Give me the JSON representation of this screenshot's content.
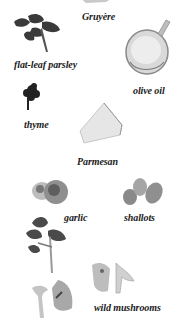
{
  "ingredients": [
    {
      "name": "Gruyère",
      "label": "Gruyère"
    },
    {
      "name": "flat-leaf parsley",
      "label": "flat-leaf parsley"
    },
    {
      "name": "olive oil",
      "label": "olive oil"
    },
    {
      "name": "thyme",
      "label": "thyme"
    },
    {
      "name": "Parmesan",
      "label": "Parmesan"
    },
    {
      "name": "garlic",
      "label": "garlic"
    },
    {
      "name": "shallots",
      "label": "shallots"
    },
    {
      "name": "wild mushrooms",
      "label": "wild mushrooms"
    }
  ],
  "colors": {
    "background": "#ffffff",
    "text": "#1a1a1a"
  }
}
